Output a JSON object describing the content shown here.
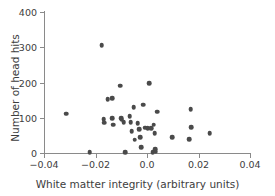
{
  "chart_data": {
    "type": "scatter",
    "title": "",
    "xlabel": "White matter integrity (arbitrary units)",
    "ylabel": "Number of head hits",
    "xlim": [
      -0.04,
      0.04
    ],
    "ylim": [
      0,
      400
    ],
    "xticks": [
      -0.04,
      -0.02,
      0.0,
      0.02,
      0.04
    ],
    "xticklabels": [
      "−0.04",
      "−0.02",
      "0.0",
      "0.02",
      "0.04"
    ],
    "yticks": [
      0,
      100,
      200,
      300,
      400
    ],
    "yticklabels": [
      "0",
      "100",
      "200",
      "300",
      "400"
    ],
    "grid": false,
    "legend": false,
    "marker_color": "#4a4a4a",
    "axis_color": "#8a8a8a",
    "points": [
      {
        "x": -0.0313,
        "y": 112
      },
      {
        "x": -0.0222,
        "y": 3
      },
      {
        "x": -0.0176,
        "y": 305
      },
      {
        "x": -0.0168,
        "y": 96
      },
      {
        "x": -0.0166,
        "y": 86
      },
      {
        "x": -0.0152,
        "y": 152
      },
      {
        "x": -0.0136,
        "y": 155
      },
      {
        "x": -0.0134,
        "y": 98
      },
      {
        "x": -0.0131,
        "y": 80
      },
      {
        "x": -0.0105,
        "y": 191
      },
      {
        "x": -0.0101,
        "y": 98
      },
      {
        "x": -0.0098,
        "y": 94
      },
      {
        "x": -0.0091,
        "y": 88
      },
      {
        "x": -0.0085,
        "y": 3
      },
      {
        "x": -0.0067,
        "y": 104
      },
      {
        "x": -0.0063,
        "y": 88
      },
      {
        "x": -0.0059,
        "y": 62
      },
      {
        "x": -0.0052,
        "y": 130
      },
      {
        "x": -0.0048,
        "y": 38
      },
      {
        "x": -0.0036,
        "y": 84
      },
      {
        "x": -0.003,
        "y": 68
      },
      {
        "x": -0.0026,
        "y": 44
      },
      {
        "x": -0.0022,
        "y": 16
      },
      {
        "x": -0.0014,
        "y": 137
      },
      {
        "x": -0.0006,
        "y": 72
      },
      {
        "x": 0.0002,
        "y": 70
      },
      {
        "x": 0.0008,
        "y": 198
      },
      {
        "x": 0.0016,
        "y": 70
      },
      {
        "x": 0.0022,
        "y": 3
      },
      {
        "x": 0.0026,
        "y": 80
      },
      {
        "x": 0.003,
        "y": 56
      },
      {
        "x": 0.0032,
        "y": 10
      },
      {
        "x": 0.0034,
        "y": 4
      },
      {
        "x": 0.004,
        "y": 117
      },
      {
        "x": 0.0097,
        "y": 45
      },
      {
        "x": 0.0163,
        "y": 39
      },
      {
        "x": 0.0169,
        "y": 124
      },
      {
        "x": 0.0172,
        "y": 73
      },
      {
        "x": 0.0243,
        "y": 56
      }
    ]
  }
}
